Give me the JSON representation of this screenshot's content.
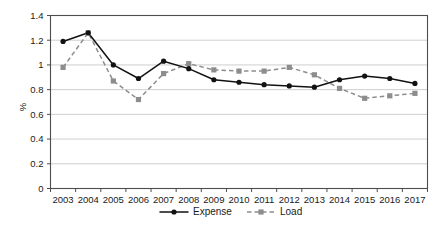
{
  "chart_data": {
    "type": "line",
    "title": "",
    "xlabel": "",
    "ylabel": "%",
    "ylim": [
      0,
      1.4
    ],
    "y_ticks": [
      "0",
      "0.2",
      "0.4",
      "0.6",
      "0.8",
      "1",
      "1.2",
      "1.4"
    ],
    "y_tick_values": [
      0,
      0.2,
      0.4,
      0.6,
      0.8,
      1.0,
      1.2,
      1.4
    ],
    "grid": true,
    "legend_position": "bottom",
    "categories": [
      "2003",
      "2004",
      "2005",
      "2006",
      "2007",
      "2008",
      "2009",
      "2010",
      "2011",
      "2012",
      "2013",
      "2014",
      "2015",
      "2016",
      "2017"
    ],
    "x": [
      2003,
      2004,
      2005,
      2006,
      2007,
      2008,
      2009,
      2010,
      2011,
      2012,
      2013,
      2014,
      2015,
      2016,
      2017
    ],
    "series": [
      {
        "name": "Expense",
        "color": "#121212",
        "style": "solid",
        "marker": "circle",
        "values": [
          1.19,
          1.26,
          1.0,
          0.89,
          1.03,
          0.97,
          0.88,
          0.86,
          0.84,
          0.83,
          0.82,
          0.88,
          0.91,
          0.89,
          0.85
        ]
      },
      {
        "name": "Load",
        "color": "#8d8d8d",
        "style": "dashed",
        "marker": "square",
        "values": [
          0.98,
          1.26,
          0.87,
          0.72,
          0.93,
          1.01,
          0.96,
          0.95,
          0.95,
          0.98,
          0.92,
          0.81,
          0.73,
          0.75,
          0.77
        ]
      }
    ]
  },
  "legend": {
    "items": [
      {
        "label": "Expense"
      },
      {
        "label": "Load"
      }
    ]
  },
  "colors": {
    "expense": "#121212",
    "load": "#8d8d8d",
    "grid": "#b9b9b9",
    "axis": "#4d4d4d",
    "background": "#ffffff"
  }
}
